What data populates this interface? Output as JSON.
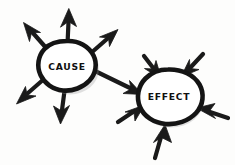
{
  "diagram": {
    "medium": "hand-drawn marker sketch",
    "background_color": "#fdfdfc",
    "ink_color": "#171717",
    "width": 235,
    "height": 165,
    "nodes": [
      {
        "id": "cause",
        "label": "CAUSE",
        "shape": "hand-drawn-circle",
        "center_x": 67,
        "center_y": 66,
        "radius_x": 28,
        "radius_y": 25,
        "label_x": 67,
        "label_y": 66
      },
      {
        "id": "effect",
        "label": "EFFECT",
        "shape": "hand-drawn-circle",
        "center_x": 168,
        "center_y": 97,
        "radius_x": 32,
        "radius_y": 27,
        "label_x": 169,
        "label_y": 96
      }
    ],
    "arrows": [
      {
        "id": "cause-out-up",
        "from": "cause",
        "direction": "up",
        "type": "outgoing"
      },
      {
        "id": "cause-out-upper-left",
        "from": "cause",
        "direction": "upper-left",
        "type": "outgoing"
      },
      {
        "id": "cause-out-upper-right",
        "from": "cause",
        "direction": "upper-right",
        "type": "outgoing"
      },
      {
        "id": "cause-out-lower-left",
        "from": "cause",
        "direction": "lower-left",
        "type": "outgoing"
      },
      {
        "id": "cause-out-down",
        "from": "cause",
        "direction": "down",
        "type": "outgoing"
      },
      {
        "id": "cause-to-effect",
        "from": "cause",
        "to": "effect",
        "type": "connector",
        "direction": "right-down"
      },
      {
        "id": "effect-in-top-left",
        "to": "effect",
        "direction": "down-right",
        "type": "incoming"
      },
      {
        "id": "effect-in-top-right",
        "to": "effect",
        "direction": "down-left",
        "type": "incoming"
      },
      {
        "id": "effect-in-left",
        "to": "effect",
        "direction": "up-right",
        "type": "incoming"
      },
      {
        "id": "effect-in-right",
        "to": "effect",
        "direction": "left",
        "type": "incoming"
      },
      {
        "id": "effect-in-bottom",
        "to": "effect",
        "direction": "up",
        "type": "incoming"
      }
    ],
    "counts": {
      "cause_outgoing": 6,
      "effect_incoming": 6
    }
  }
}
